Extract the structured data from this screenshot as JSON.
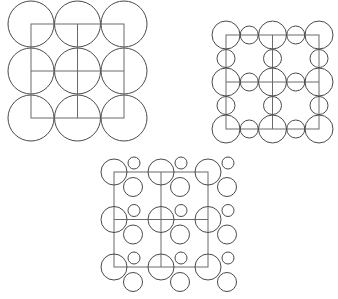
{
  "diagram": {
    "colors": {
      "background": "#ffffff",
      "stroke": "#4a4a4a",
      "grid": "#6a6a6a"
    },
    "panels": [
      {
        "id": "panel-1",
        "label": "",
        "grid": {
          "x0": 31,
          "y0": 24,
          "step_x": 46.5,
          "step_y": 47,
          "cols": 2,
          "rows": 2
        },
        "big_circle_radius": 23,
        "pattern": "big-circle-at-every-node"
      },
      {
        "id": "panel-2",
        "label": "",
        "grid": {
          "x0": 226,
          "y0": 35,
          "step_x": 46.5,
          "step_y": 47,
          "cols": 2,
          "rows": 2
        },
        "big_circle_radius": 14,
        "small_circle_radius": 9,
        "pattern": "big-circle-at-nodes-small-circle-at-edge-midpoints"
      },
      {
        "id": "panel-3",
        "label": "",
        "grid": {
          "x0": 114,
          "y0": 172,
          "step_x": 47,
          "step_y": 47.5,
          "cols": 2,
          "rows": 2
        },
        "big_circle_radius": 13,
        "small_circle": {
          "dx": 20,
          "dy": -9,
          "r": 6
        },
        "medium_circle": {
          "dx": 19,
          "dy": 15,
          "r": 9.5
        },
        "pattern": "big-circle-at-nodes-plus-small-and-medium-satellites"
      }
    ]
  }
}
